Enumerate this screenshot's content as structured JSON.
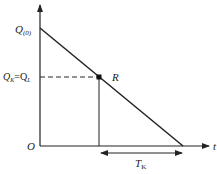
{
  "diagram": {
    "labels": {
      "y_intercept": "Q",
      "y_intercept_sub": "(0)",
      "level_q": "Q",
      "level_q_sub": "K",
      "level_eq": "=Q",
      "level_eq_sub": "L",
      "point": "R",
      "origin": "O",
      "x_axis": "t",
      "interval": "T",
      "interval_sub": "K"
    },
    "colors": {
      "line": "#222222"
    }
  }
}
